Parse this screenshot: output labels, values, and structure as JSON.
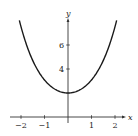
{
  "chart_data": {
    "type": "line",
    "title": "",
    "function": "y = e^x + e^(-x)",
    "xlabel": "x",
    "ylabel": "y",
    "x_ticks": [
      -2,
      -1,
      1,
      2
    ],
    "x_tick_labels": [
      "−2",
      "−1",
      "1",
      "2"
    ],
    "y_ticks": [
      4,
      6
    ],
    "y_tick_labels": [
      "4",
      "6"
    ],
    "xlim": [
      -2.5,
      2.4
    ],
    "ylim": [
      -0.5,
      8.4
    ],
    "grid": false,
    "legend": null,
    "series": [
      {
        "name": "curve",
        "x": [
          -2.07,
          -2.0,
          -1.5,
          -1.0,
          -0.5,
          0.0,
          0.5,
          1.0,
          1.5,
          2.0,
          2.07
        ],
        "values": [
          8.05,
          7.52,
          4.7,
          3.09,
          2.26,
          2.0,
          2.26,
          3.09,
          4.7,
          7.52,
          8.05
        ]
      }
    ],
    "x_range_plotted": [
      -2.07,
      2.07
    ],
    "colors": {
      "curve": "#1a1a1a",
      "axes": "#333333"
    }
  }
}
